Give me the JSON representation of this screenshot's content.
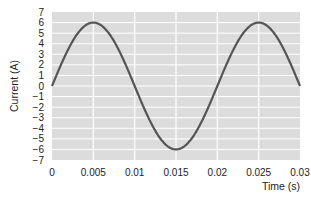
{
  "chart_data": {
    "type": "line",
    "title": "",
    "xlabel": "Time (s)",
    "ylabel": "Current (A)",
    "xlim": [
      0,
      0.03
    ],
    "ylim": [
      -7,
      7
    ],
    "grid": true,
    "legend": null,
    "x_ticks": [
      "0",
      "0.005",
      "0.01",
      "0.015",
      "0.02",
      "0.025",
      "0.03"
    ],
    "y_ticks": [
      "7",
      "6",
      "5",
      "4",
      "3",
      "2",
      "1",
      "0",
      "−1",
      "−2",
      "−3",
      "−4",
      "−5",
      "−6",
      "−7"
    ],
    "series": [
      {
        "name": "Current",
        "function": "6*sin(2*pi*50*t)",
        "amplitude": 6,
        "frequency_hz": 50,
        "x": [
          0,
          0.0025,
          0.005,
          0.0075,
          0.01,
          0.0125,
          0.015,
          0.0175,
          0.02,
          0.0225,
          0.025,
          0.0275,
          0.03
        ],
        "values": [
          0,
          4.24,
          6,
          4.24,
          0,
          -4.24,
          -6,
          -4.24,
          0,
          4.24,
          6,
          4.24,
          0
        ]
      }
    ]
  },
  "colors": {
    "plot_background": "#dcdcdc",
    "gridline": "#ffffff",
    "curve": "#555555",
    "text": "#222222"
  }
}
